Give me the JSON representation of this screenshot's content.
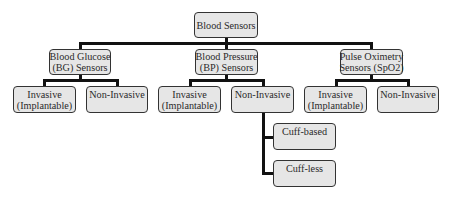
{
  "diagram": {
    "title": "Blood Sensors",
    "root": {
      "label": "Blood Sensors"
    },
    "categories": [
      {
        "label_line1": "Blood Glucose",
        "label_line2": "(BG) Sensors",
        "children": [
          {
            "label_line1": "Invasive",
            "label_line2": "(Implantable)"
          },
          {
            "label_line1": "Non-Invasive",
            "label_line2": ""
          }
        ]
      },
      {
        "label_line1": "Blood Pressure",
        "label_line2": "(BP) Sensors",
        "children": [
          {
            "label_line1": "Invasive",
            "label_line2": "(Implantable)"
          },
          {
            "label_line1": "Non-Invasive",
            "label_line2": "",
            "children": [
              {
                "label": "Cuff-based"
              },
              {
                "label": "Cuff-less"
              }
            ]
          }
        ]
      },
      {
        "label_line1": "Pulse Oximetry",
        "label_line2": "Sensors (SpO2)",
        "children": [
          {
            "label_line1": "Invasive",
            "label_line2": "(Implantable)"
          },
          {
            "label_line1": "Non-Invasive",
            "label_line2": ""
          }
        ]
      }
    ],
    "colors": {
      "box_fill": "#e6e6e6",
      "box_border": "#333333",
      "connector": "#111111"
    }
  }
}
